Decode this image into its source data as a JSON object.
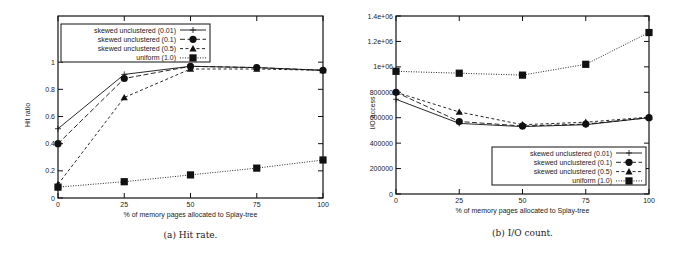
{
  "chart_data": [
    {
      "type": "line",
      "title": "",
      "caption": "(a) Hit rate.",
      "xlabel": "% of memory pages allocated to Splay-tree",
      "ylabel": "Hit ratio",
      "x": [
        0,
        25,
        50,
        75,
        100
      ],
      "xticks": [
        "0",
        "25",
        "50",
        "75",
        "100"
      ],
      "yticks": [
        "0",
        "0.2",
        "0.4",
        "0.6",
        "0.8",
        "1"
      ],
      "xlim": [
        0,
        100
      ],
      "ylim": [
        0,
        1.34
      ],
      "grid": false,
      "legend_position": "top-left inside",
      "series": [
        {
          "name": "skewed unclustered (0.01)",
          "marker": "plus",
          "dash": "solid",
          "values": [
            0.51,
            0.91,
            0.97,
            0.96,
            0.94
          ]
        },
        {
          "name": "skewed unclustered (0.1)",
          "marker": "circle",
          "dash": "long-dash",
          "values": [
            0.4,
            0.88,
            0.97,
            0.96,
            0.94
          ]
        },
        {
          "name": "skewed unclustered (0.5)",
          "marker": "triangle",
          "dash": "short-dash",
          "values": [
            0.1,
            0.74,
            0.95,
            0.95,
            0.94
          ]
        },
        {
          "name": "uniform (1.0)",
          "marker": "square",
          "dash": "dotted",
          "values": [
            0.08,
            0.12,
            0.17,
            0.22,
            0.28
          ]
        }
      ]
    },
    {
      "type": "line",
      "title": "",
      "caption": "(b) I/O count.",
      "xlabel": "% of memory pages allocated to Splay-tree",
      "ylabel": "I/O access",
      "x": [
        0,
        25,
        50,
        75,
        100
      ],
      "xticks": [
        "0",
        "25",
        "50",
        "75",
        "100"
      ],
      "yticks": [
        "0",
        "200000",
        "400000",
        "600000",
        "800000",
        "1e+06",
        "1.2e+06",
        "1.4e+06"
      ],
      "xlim": [
        0,
        100
      ],
      "ylim": [
        0,
        1400000
      ],
      "grid": false,
      "legend_position": "bottom-right inside",
      "series": [
        {
          "name": "skewed unclustered (0.01)",
          "marker": "plus",
          "dash": "solid",
          "values": [
            745000,
            555000,
            530000,
            545000,
            600000
          ]
        },
        {
          "name": "skewed unclustered (0.1)",
          "marker": "circle",
          "dash": "long-dash",
          "values": [
            800000,
            570000,
            535000,
            550000,
            600000
          ]
        },
        {
          "name": "skewed unclustered (0.5)",
          "marker": "triangle",
          "dash": "short-dash",
          "values": [
            800000,
            645000,
            545000,
            565000,
            605000
          ]
        },
        {
          "name": "uniform (1.0)",
          "marker": "square",
          "dash": "dotted",
          "values": [
            965000,
            950000,
            935000,
            1020000,
            1270000
          ]
        }
      ]
    }
  ]
}
